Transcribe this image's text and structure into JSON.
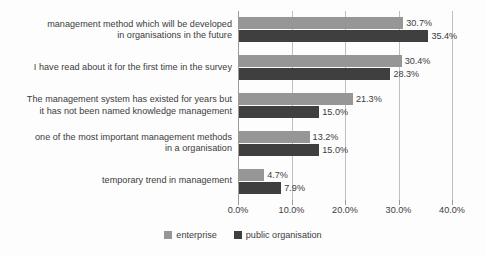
{
  "chart_data": {
    "type": "bar",
    "orientation": "horizontal",
    "title": "",
    "subtitle": "",
    "xlabel": "",
    "ylabel": "",
    "xlim": [
      0,
      40
    ],
    "xticks": [
      0,
      10,
      20,
      30,
      40
    ],
    "xtick_labels": [
      "0.0%",
      "10.0%",
      "20.0%",
      "30.0%",
      "40.0%"
    ],
    "grid": true,
    "grid_axis": "x",
    "legend_position": "bottom-center",
    "value_label_suffix": "%",
    "categories": [
      "management method which will be developed in organisations in the future",
      "I have read about it for the first time in the survey",
      "The management system has existed for years but it has not been named knowledge management",
      "one of the most important management methods in a organisation",
      "temporary trend in management"
    ],
    "category_lines": [
      [
        "management method which will be developed",
        "in organisations in the future"
      ],
      [
        "I have read about it for the first time in the survey"
      ],
      [
        "The management system has existed for years but",
        "it has not been named knowledge management"
      ],
      [
        "one of the most important management methods",
        "in a organisation"
      ],
      [
        "temporary trend in management"
      ]
    ],
    "series": [
      {
        "name": "enterprise",
        "color": "#969696",
        "values": [
          30.7,
          30.4,
          21.3,
          13.2,
          4.7
        ],
        "value_labels": [
          "30.7%",
          "30.4%",
          "21.3%",
          "13.2%",
          "4.7%"
        ]
      },
      {
        "name": "public organisation",
        "color": "#3f3f3f",
        "values": [
          35.4,
          28.3,
          15.0,
          15.0,
          7.9
        ],
        "value_labels": [
          "35.4%",
          "28.3%",
          "15.0%",
          "15.0%",
          "7.9%"
        ]
      }
    ]
  },
  "legend": {
    "entries": [
      {
        "label": "enterprise",
        "color": "#969696"
      },
      {
        "label": "public organisation",
        "color": "#3f3f3f"
      }
    ]
  }
}
